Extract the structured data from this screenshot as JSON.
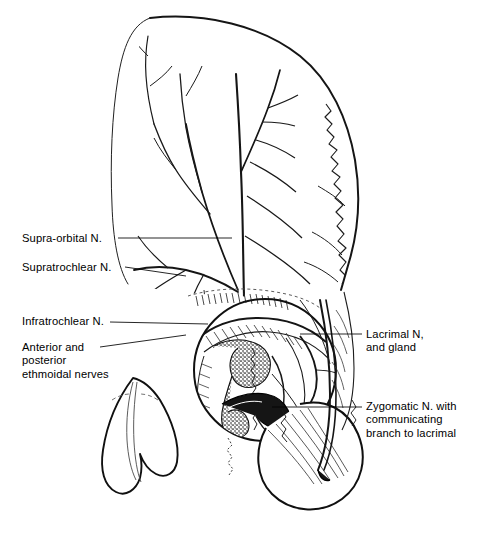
{
  "figure": {
    "width": 482,
    "height": 539,
    "background": "#ffffff",
    "ink": "#000000",
    "shadow": "#c8c8c8"
  },
  "labels": {
    "supraorbital": {
      "text": "Supra-orbital N.",
      "x": 22,
      "y": 232,
      "side": "left"
    },
    "supratrochlear": {
      "text": "Supratrochlear N.",
      "x": 22,
      "y": 261,
      "side": "left"
    },
    "infratrochlear": {
      "text": "Infratrochlear N.",
      "x": 22,
      "y": 315,
      "side": "left"
    },
    "ethmoidal": {
      "text": "Anterior and\nposterior\nethmoidal nerves",
      "x": 22,
      "y": 341,
      "side": "left"
    },
    "lacrimal": {
      "text": "Lacrimal N,\nand gland",
      "x": 366,
      "y": 328,
      "side": "right"
    },
    "zygomatic": {
      "text": "Zygomatic N. with\ncommunicating\nbranch to lacrimal",
      "x": 366,
      "y": 400,
      "side": "right"
    }
  },
  "leaders": [
    {
      "name": "leader-supraorbital",
      "x1": 118,
      "y1": 238,
      "x2": 232,
      "y2": 238
    },
    {
      "name": "leader-supratrochlear",
      "x1": 125,
      "y1": 267,
      "x2": 186,
      "y2": 276
    },
    {
      "name": "leader-infratrochlear",
      "x1": 110,
      "y1": 322,
      "x2": 208,
      "y2": 324
    },
    {
      "name": "leader-ethmoidal",
      "x1": 100,
      "y1": 347,
      "x2": 186,
      "y2": 335
    },
    {
      "name": "leader-lacrimal",
      "x1": 300,
      "y1": 334,
      "x2": 362,
      "y2": 334
    },
    {
      "name": "leader-zygomatic",
      "x1": 272,
      "y1": 407,
      "x2": 362,
      "y2": 407
    }
  ],
  "structures": {
    "forehead_flap": "forehead-scalp-flap",
    "temporal_suture": "zigzag-temporal-suture",
    "orbit_rim": "orbital-rim-circle",
    "lacrimal_gland": "stippled-lacrimal-gland",
    "nose": "external-nose",
    "cheek": "cheek-soft-tissue",
    "nerve_trunks": "supraorbital-supratrochlear-branches"
  }
}
